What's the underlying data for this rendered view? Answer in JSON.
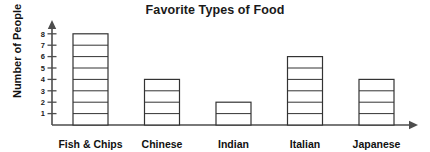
{
  "chart_data": {
    "type": "bar",
    "title": "Favorite Types of Food",
    "xlabel": "",
    "ylabel": "Number of People",
    "categories": [
      "Fish & Chips",
      "Chinese",
      "Indian",
      "Italian",
      "Japanese"
    ],
    "values": [
      8,
      4,
      2,
      6,
      4
    ],
    "ylim": [
      0,
      8
    ],
    "y_ticks": [
      "1",
      "2",
      "3",
      "4",
      "5",
      "6",
      "7",
      "8"
    ],
    "grid": false,
    "legend": null,
    "style": {
      "bar_fill": "#ffffff",
      "bar_stroke": "#333333",
      "axis_color": "#4d4d4d",
      "text_color": "#111111",
      "background": "#ffffff",
      "segmented_bars": true
    },
    "axis_arrows": {
      "x": "arrow-right",
      "y": "arrow-up"
    }
  }
}
